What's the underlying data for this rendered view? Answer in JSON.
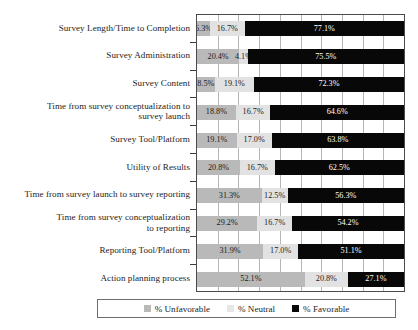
{
  "chart_data": {
    "type": "bar",
    "subtype": "stacked-horizontal-100",
    "title": "",
    "xlabel": "",
    "ylabel": "",
    "xlim": [
      0,
      100
    ],
    "grid": true,
    "gridline_step": 10,
    "axis_tick_labels": [],
    "legend_position": "bottom",
    "categories": [
      "Survey Length/Time to Completion",
      "Survey Administration",
      "Survey Content",
      "Time from survey conceptualization to survey launch",
      "Survey Tool/Platform",
      "Utility of Results",
      "Time from survey launch to survey reporting",
      "Time from survey conceptualization to reporting",
      "Reporting Tool/Platform",
      "Action planning process"
    ],
    "category_lines": [
      [
        "Survey Length/Time to Completion"
      ],
      [
        "Survey Administration"
      ],
      [
        "Survey Content"
      ],
      [
        "Time from survey conceptualization to",
        "survey launch"
      ],
      [
        "Survey Tool/Platform"
      ],
      [
        "Utility of Results"
      ],
      [
        "Time from survey launch to survey reporting"
      ],
      [
        "Time from survey conceptualization",
        "to reporting"
      ],
      [
        "Reporting Tool/Platform"
      ],
      [
        "Action planning process"
      ]
    ],
    "series": [
      {
        "name": "% Unfavorable",
        "color": "#b9b9b9",
        "values": [
          6.3,
          20.4,
          8.5,
          18.8,
          19.1,
          20.8,
          31.3,
          29.2,
          31.9,
          52.1
        ],
        "labels": [
          "6.3%",
          "20.4%",
          "8.5%",
          "18.8%",
          "19.1%",
          "20.8%",
          "31.3%",
          "29.2%",
          "31.9%",
          "52.1%"
        ]
      },
      {
        "name": "% Neutral",
        "color": "#e2e2e2",
        "values": [
          16.7,
          4.1,
          19.1,
          16.7,
          17.0,
          16.7,
          12.5,
          16.7,
          17.0,
          20.8
        ],
        "labels": [
          "16.7%",
          "4.1%",
          "19.1%",
          "16.7%",
          "17.0%",
          "16.7%",
          "12.5%",
          "16.7%",
          "17.0%",
          "20.8%"
        ]
      },
      {
        "name": "% Favorable",
        "color": "#080808",
        "values": [
          77.1,
          75.5,
          72.3,
          64.6,
          63.8,
          62.5,
          56.3,
          54.2,
          51.1,
          27.1
        ],
        "labels": [
          "77.1%",
          "75.5%",
          "72.3%",
          "64.6%",
          "63.8%",
          "62.5%",
          "56.3%",
          "54.2%",
          "51.1%",
          "27.1%"
        ]
      }
    ]
  },
  "legend": {
    "items": [
      {
        "label": "% Unfavorable",
        "swatch": "unfav"
      },
      {
        "label": "% Neutral",
        "swatch": "neut"
      },
      {
        "label": "% Favorable",
        "swatch": "fav"
      }
    ]
  }
}
